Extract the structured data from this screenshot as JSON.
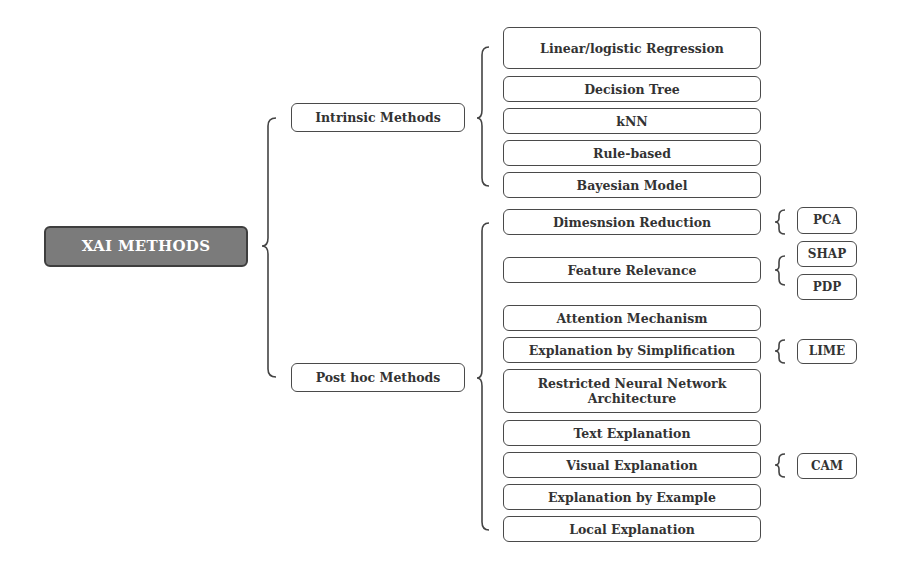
{
  "root": {
    "label": "XAI METHODS"
  },
  "branches": [
    {
      "label": "Intrinsic Methods",
      "items": [
        {
          "label": "Linear/logistic Regression"
        },
        {
          "label": "Decision Tree"
        },
        {
          "label": "kNN"
        },
        {
          "label": "Rule-based"
        },
        {
          "label": "Bayesian Model"
        }
      ]
    },
    {
      "label": "Post hoc Methods",
      "items": [
        {
          "label": "Dimesnsion Reduction",
          "examples": [
            "PCA"
          ]
        },
        {
          "label": "Feature Relevance",
          "examples": [
            "SHAP",
            "PDP"
          ]
        },
        {
          "label": "Attention Mechanism"
        },
        {
          "label": "Explanation by Simplification",
          "examples": [
            "LIME"
          ]
        },
        {
          "label": "Restricted Neural Network Architecture"
        },
        {
          "label": "Text Explanation"
        },
        {
          "label": "Visual Explanation",
          "examples": [
            "CAM"
          ]
        },
        {
          "label": "Explanation by Example"
        },
        {
          "label": "Local Explanation"
        }
      ]
    }
  ],
  "colors": {
    "root_fill": "#7b7b7b",
    "root_border": "#3e3e3e",
    "box_border": "#4a4a4a",
    "text": "#333333"
  }
}
